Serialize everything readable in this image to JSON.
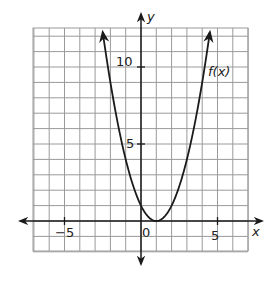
{
  "chart_data": {
    "type": "line",
    "title": "",
    "xlabel": "x",
    "ylabel": "y",
    "function_label": "f(x)",
    "function": "f(x) = (x - 1)^2",
    "xlim": [
      -7,
      7
    ],
    "ylim": [
      -2,
      12.5
    ],
    "grid": true,
    "grid_step": 1,
    "x_ticks": [
      {
        "value": -5,
        "label": "−5"
      },
      {
        "value": 0,
        "label": "0"
      },
      {
        "value": 5,
        "label": "5"
      }
    ],
    "y_ticks": [
      {
        "value": 5,
        "label": "5"
      },
      {
        "value": 10,
        "label": "10"
      }
    ],
    "series": [
      {
        "name": "f(x)",
        "x": [
          -2.5,
          -2,
          -1.5,
          -1,
          -0.5,
          0,
          0.5,
          1,
          1.5,
          2,
          2.5,
          3,
          3.5,
          4,
          4.5
        ],
        "y": [
          12.25,
          9,
          6.25,
          4,
          2.25,
          1,
          0.25,
          0,
          0.25,
          1,
          2.25,
          4,
          6.25,
          9,
          12.25
        ]
      }
    ],
    "vertex": [
      1,
      0
    ],
    "colors": {
      "grid": "#9a9a9a",
      "axis": "#1a1a1a",
      "curve": "#1a1a1a"
    }
  },
  "labels": {
    "x_axis": "x",
    "y_axis": "y",
    "curve": "f(x)",
    "origin": "0",
    "tick_x_neg5": "−5",
    "tick_x_5": "5",
    "tick_y_5": "5",
    "tick_y_10": "10"
  }
}
